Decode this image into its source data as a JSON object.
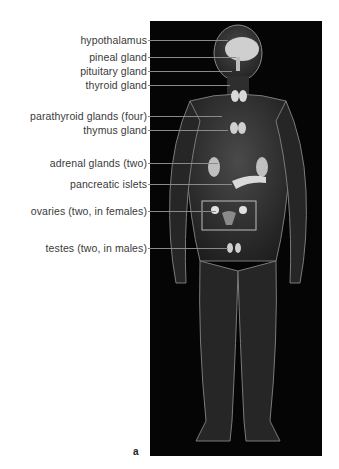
{
  "figure": {
    "panel_letter": "a",
    "background_color": "#050505",
    "body_glow_color": "#9a9a9a",
    "gland_color": "#d9d9d9",
    "labels": [
      {
        "text": "hypothalamus",
        "y": 40
      },
      {
        "text": "pineal gland",
        "y": 57
      },
      {
        "text": "pituitary gland",
        "y": 71
      },
      {
        "text": "thyroid gland",
        "y": 85
      },
      {
        "text": "parathyroid glands (four)",
        "y": 116
      },
      {
        "text": "thymus gland",
        "y": 130
      },
      {
        "text": "adrenal glands (two)",
        "y": 163
      },
      {
        "text": "pancreatic  islets",
        "y": 184
      },
      {
        "text": "ovaries (two, in females)",
        "y": 211
      },
      {
        "text": "testes (two, in males)",
        "y": 248
      }
    ]
  }
}
